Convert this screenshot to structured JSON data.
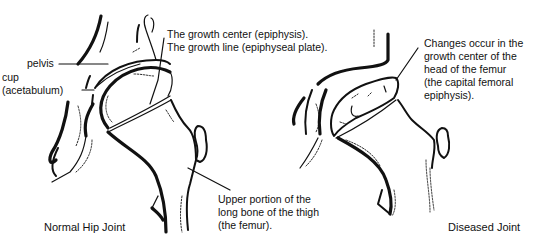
{
  "figure": {
    "panels": [
      {
        "id": "normal",
        "caption": "Normal Hip Joint",
        "labels": {
          "pelvis": "pelvis",
          "cup_line1": "cup",
          "cup_line2": "(acetabulum)",
          "growth_center": "The growth center (epiphysis).",
          "growth_line": "The growth line (epiphyseal plate).",
          "femur_line1": "Upper portion of the",
          "femur_line2": "long bone of the thigh",
          "femur_line3": "(the femur)."
        }
      },
      {
        "id": "diseased",
        "caption": "Diseased Joint",
        "labels": {
          "changes_line1": "Changes occur in the",
          "changes_line2": "growth center of the",
          "changes_line3": "head of the femur",
          "changes_line4": "(the capital femoral",
          "changes_line5": "epiphysis)."
        }
      }
    ],
    "colors": {
      "ink": "#111111",
      "background": "#ffffff"
    }
  }
}
